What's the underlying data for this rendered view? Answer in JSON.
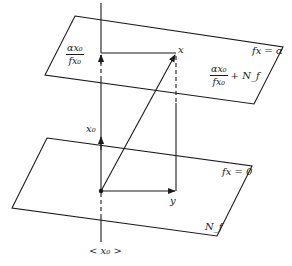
{
  "diagram": {
    "type": "geometric-projection",
    "upper_plane": {
      "label": "fx = α",
      "corners": [
        [
          75,
          16
        ],
        [
          283,
          47
        ],
        [
          254,
          104
        ],
        [
          45,
          75
        ]
      ],
      "set_label": {
        "numerator": "αx₀",
        "denominator": "fx₀",
        "suffix": "+ N_f"
      }
    },
    "lower_plane": {
      "label": "fx = 0",
      "corners": [
        [
          47,
          138
        ],
        [
          252,
          166
        ],
        [
          217,
          236
        ],
        [
          12,
          208
        ]
      ],
      "set_label": "N_f"
    },
    "axis": {
      "label": "< x₀ >",
      "x": 101,
      "top": 3,
      "bottom": 242
    },
    "points": {
      "origin": {
        "x": 101,
        "y": 191
      },
      "x": {
        "label": "x",
        "x": 176,
        "y": 53
      },
      "y": {
        "label": "y",
        "x": 176,
        "y": 191
      },
      "scaled_x0": {
        "x": 101,
        "y": 53
      }
    },
    "vectors": [
      {
        "name": "x0",
        "label": "x₀",
        "from": [
          101,
          191
        ],
        "to": [
          101,
          137
        ]
      },
      {
        "name": "x",
        "from": [
          101,
          191
        ],
        "to": [
          176,
          53
        ]
      },
      {
        "name": "y",
        "label": "y",
        "from": [
          101,
          191
        ],
        "to": [
          176,
          191
        ]
      },
      {
        "name": "scaled-x0",
        "from": [
          101,
          191
        ],
        "to": [
          101,
          53
        ],
        "dashed_segment": true
      }
    ],
    "labels": {
      "upper_left_fraction": {
        "numerator": "αx₀",
        "denominator": "fx₀"
      },
      "x0_vector": "x₀",
      "x_point": "x",
      "y_point": "y",
      "upper_plane_eq": "fx = α",
      "lower_plane_eq": "fx = 0",
      "nullspace": "N_f",
      "axis": "< x₀ >"
    },
    "colors": {
      "ink": "#1a1a1a",
      "background": "#ffffff"
    }
  }
}
